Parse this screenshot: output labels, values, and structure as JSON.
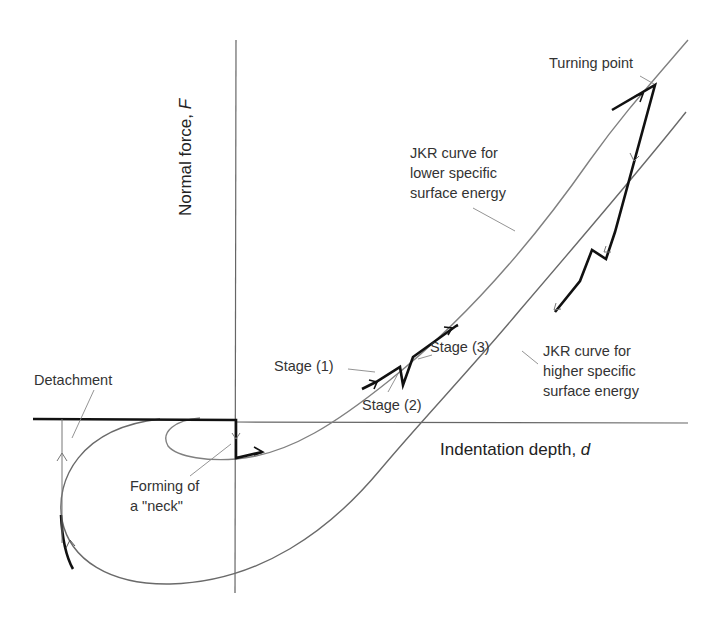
{
  "diagram": {
    "axes": {
      "y_label": "Normal force,",
      "y_symbol": "F",
      "x_label": "Indentation depth,",
      "x_symbol": "d"
    },
    "labels": {
      "turning_point": "Turning point",
      "jkr_lower": [
        "JKR curve for",
        "lower specific",
        "surface energy"
      ],
      "jkr_higher": [
        "JKR curve for",
        "higher specific",
        "surface energy"
      ],
      "stage1": "Stage (1)",
      "stage2": "Stage (2)",
      "stage3": "Stage (3)",
      "detachment": "Detachment",
      "neck": [
        "Forming of",
        "a \"neck\""
      ]
    },
    "colors": {
      "thin_curve": "#7a7a7a",
      "thick_path": "#111111",
      "axis": "#555555",
      "text": "#333333"
    }
  }
}
